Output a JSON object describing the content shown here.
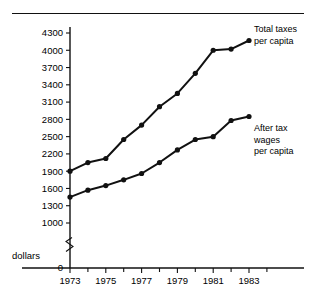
{
  "figure": {
    "name": "line-chart-total-taxes-and-after-tax-wages",
    "y_axis_caption": "dollars"
  },
  "chart_data": {
    "type": "line",
    "title": "",
    "subtitle": "",
    "xlabel": "",
    "ylabel": "dollars",
    "x": [
      1973,
      1974,
      1975,
      1976,
      1977,
      1978,
      1979,
      1980,
      1981,
      1982,
      1983
    ],
    "xtick_labels": [
      "1973",
      "1975",
      "1977",
      "1979",
      "1981",
      "1983"
    ],
    "xtick_values": [
      1973,
      1975,
      1977,
      1979,
      1981,
      1983
    ],
    "xminor_values": [
      1974,
      1976,
      1978,
      1980,
      1982,
      1984
    ],
    "xlim": [
      1973,
      1984
    ],
    "ytick_labels": [
      "0",
      "1000",
      "1300",
      "1600",
      "1900",
      "2200",
      "2500",
      "2800",
      "3100",
      "3400",
      "3700",
      "4000",
      "4300"
    ],
    "ytick_values": [
      0,
      1000,
      1300,
      1600,
      1900,
      2200,
      2500,
      2800,
      3100,
      3400,
      3700,
      4000,
      4300
    ],
    "ylim": [
      1000,
      4300
    ],
    "axis_break": true,
    "axis_break_between": [
      0,
      1000
    ],
    "grid": false,
    "legend_position": "inline-right",
    "series": [
      {
        "name": "Total taxes per capita",
        "label_lines": [
          "Total taxes",
          "per capita"
        ],
        "values": [
          1900,
          2050,
          2120,
          2450,
          2700,
          3020,
          3250,
          3600,
          4000,
          4020,
          4170
        ]
      },
      {
        "name": "After tax wages per capita",
        "label_lines": [
          "After tax",
          "wages",
          "per capita"
        ],
        "values": [
          1450,
          1570,
          1650,
          1750,
          1860,
          2050,
          2270,
          2450,
          2500,
          2780,
          2850
        ]
      }
    ],
    "colors": {
      "line": "#111111",
      "marker": "#111111",
      "axis": "#111111",
      "background": "#ffffff"
    }
  }
}
